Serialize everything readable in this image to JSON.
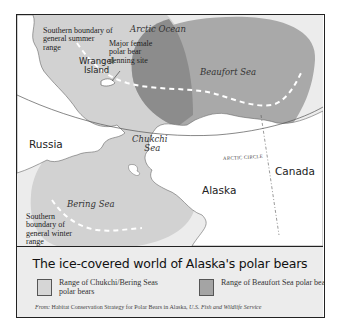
{
  "map": {
    "labels": {
      "arctic_ocean": "Arctic Ocean",
      "beaufort_sea": "Beaufort Sea",
      "chukchi_sea_1": "Chukchi",
      "chukchi_sea_2": "Sea",
      "bering_sea": "Bering Sea",
      "russia": "Russia",
      "alaska": "Alaska",
      "canada": "Canada",
      "arctic_circle": "ARCTIC CIRCLE",
      "wrangel_1": "Wrangel",
      "wrangel_2": "Island",
      "summer_boundary": [
        "Southern boundary of",
        "general summer",
        "range"
      ],
      "denning_site": [
        "Major female",
        "polar bear",
        "denning site"
      ],
      "winter_boundary": [
        "Southern",
        "boundary of",
        "general winter",
        "range"
      ]
    },
    "colors": {
      "background_ice": "#ececec",
      "chukchi_bering_range": "#d2d2d2",
      "beaufort_range": "#a9a9a9",
      "overlap": "#8c8c8c",
      "land": "#ffffff",
      "outline": "#555555"
    }
  },
  "legend": {
    "title": "The ice-covered world of Alaska's polar bears",
    "items": [
      {
        "label": "Range of Chukchi/Bering Seas polar bears",
        "color": "#d6d6d6"
      },
      {
        "label": "Range of Beaufort Sea polar bears",
        "color": "#a4a4a4"
      }
    ],
    "source_prefix": "From:",
    "source_text": "Habitat Conservation Strategy for Polar Bears in Alaska,",
    "source_agency": "U.S. Fish and Wildlife Service"
  }
}
